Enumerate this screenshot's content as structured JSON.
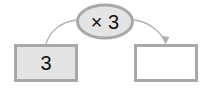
{
  "diagram": {
    "type": "function-machine",
    "title": "",
    "background_color": "#ffffff",
    "stroke_color": "#a8a8a8",
    "fill_shaded": "#e4e4e4",
    "fill_empty": "#ffffff",
    "text_color": "#111111",
    "input_box": {
      "label": "3",
      "filled": true,
      "x": 14,
      "y": 44,
      "width": 64,
      "height": 38
    },
    "operator_node": {
      "label": "× 3",
      "operation": "multiply",
      "factor": "3",
      "cx": 105,
      "cy": 21,
      "rx": 29,
      "ry": 18
    },
    "output_box": {
      "label": "",
      "filled": false,
      "x": 134,
      "y": 44,
      "width": 64,
      "height": 38
    },
    "arrows": [
      {
        "name": "input-to-operator",
        "from": "input_box",
        "to": "operator_node",
        "has_arrowhead": false
      },
      {
        "name": "operator-to-output",
        "from": "operator_node",
        "to": "output_box",
        "has_arrowhead": true
      }
    ]
  }
}
